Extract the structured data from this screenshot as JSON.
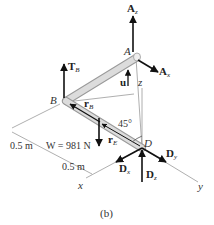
{
  "figure": {
    "caption": "(b)",
    "points": {
      "A": "A",
      "B": "B",
      "D": "D"
    },
    "axes": {
      "x": "x",
      "y": "y",
      "z": "z"
    },
    "forces": {
      "Az": {
        "main": "A",
        "sub": "z"
      },
      "Ax": {
        "main": "A",
        "sub": "x"
      },
      "TB": {
        "main": "T",
        "sub": "B"
      },
      "Dx": {
        "main": "D",
        "sub": "x"
      },
      "Dy": {
        "main": "D",
        "sub": "y"
      },
      "Dz": {
        "main": "D",
        "sub": "z"
      },
      "W": {
        "text": "W = 981 N"
      }
    },
    "vectors": {
      "u": "u",
      "rB": {
        "main": "r",
        "sub": "B"
      },
      "rE": {
        "main": "r",
        "sub": "E"
      }
    },
    "angle": "45°",
    "dimensions": {
      "d1": "0.5 m",
      "d2": "0.5 m"
    },
    "colors": {
      "rod_fill": "#d9d9d9",
      "rod_edge": "#9a9a9a",
      "arrow": "#111111",
      "thin_line": "#9a9a9a"
    }
  }
}
